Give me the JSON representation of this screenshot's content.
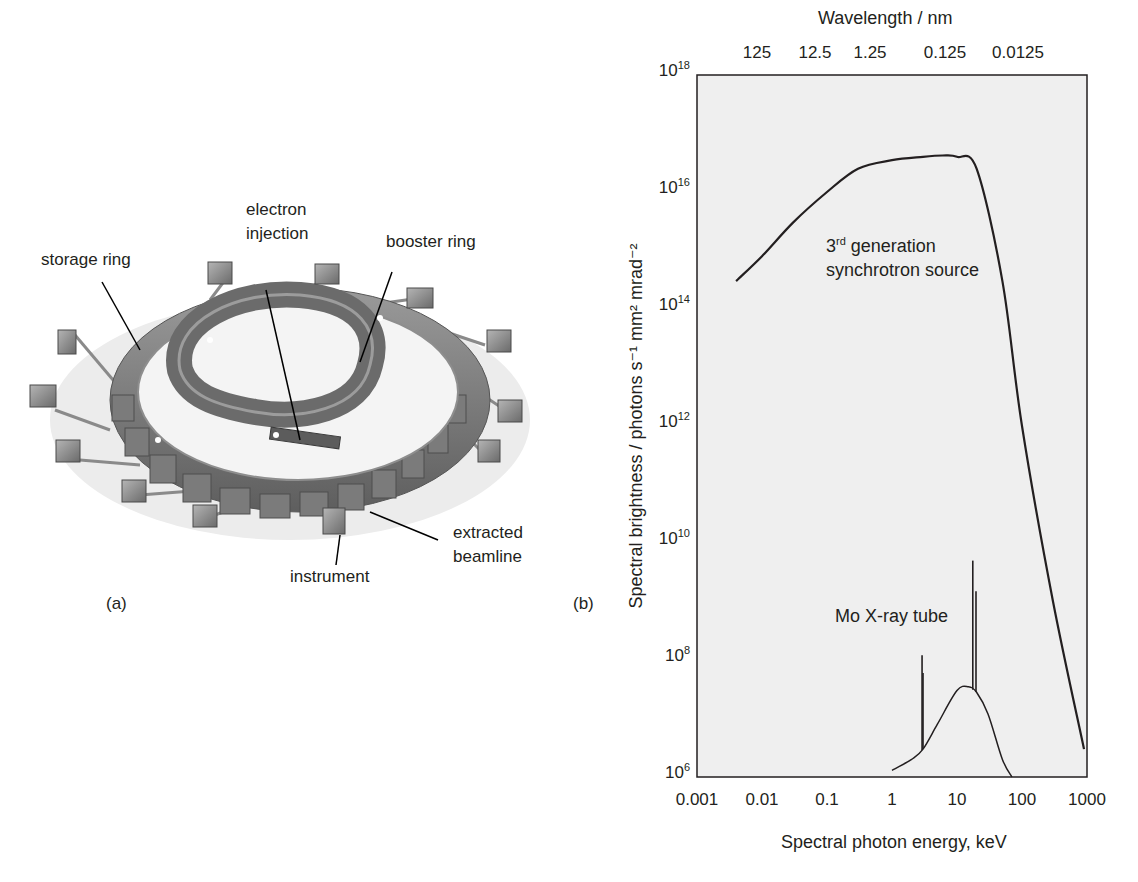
{
  "panel_a": {
    "label": "(a)",
    "title": "Synchrotron facility schematic",
    "callouts": {
      "storage_ring": "storage ring",
      "electron_injection_1": "electron",
      "electron_injection_2": "injection",
      "booster_ring": "booster ring",
      "extracted_beamline_1": "extracted",
      "extracted_beamline_2": "beamline",
      "instrument": "instrument"
    }
  },
  "panel_b": {
    "label": "(b)"
  },
  "chart_data": {
    "type": "line",
    "title": "",
    "top_axis_label": "Wavelength / nm",
    "top_ticks": [
      "125",
      "12.5",
      "1.25",
      "0.125",
      "0.0125"
    ],
    "xlabel": "Spectral photon energy, keV",
    "ylabel": "Spectral brightness / photons s⁻¹ mm² mrad⁻²",
    "x_scale": "log",
    "y_scale": "log",
    "xlim": [
      0.001,
      1000
    ],
    "ylim": [
      1000000.0,
      1e+18
    ],
    "x_ticks": [
      "0.001",
      "0.01",
      "0.1",
      "1",
      "10",
      "100",
      "1000"
    ],
    "y_ticks": [
      {
        "base": "10",
        "exp": "18"
      },
      {
        "base": "10",
        "exp": "16"
      },
      {
        "base": "10",
        "exp": "14"
      },
      {
        "base": "10",
        "exp": "12"
      },
      {
        "base": "10",
        "exp": "10"
      },
      {
        "base": "10",
        "exp": "8"
      },
      {
        "base": "10",
        "exp": "6"
      }
    ],
    "grid": false,
    "series": [
      {
        "name": "3rd generation synchrotron source",
        "annotation_1_pre": "3",
        "annotation_1_sup": "rd",
        "annotation_1_post": " generation",
        "annotation_2": "synchrotron source",
        "x": [
          0.004,
          0.01,
          0.03,
          0.1,
          0.3,
          1,
          3,
          6,
          10,
          20,
          50,
          100,
          300,
          900
        ],
        "y": [
          300000000000000.0,
          800000000000000.0,
          3000000000000000.0,
          1e+16,
          2.5e+16,
          3.5e+16,
          4e+16,
          4.2e+16,
          4e+16,
          2.5e+16,
          300000000000000.0,
          1000000000000.0,
          1000000000.0,
          3000000.0
        ]
      },
      {
        "name": "Mo X-ray tube",
        "annotation": "Mo X-ray tube",
        "x": [
          1,
          2,
          3,
          5,
          10,
          15,
          20,
          30,
          50,
          70
        ],
        "y": [
          1300000.0,
          2000000.0,
          3000000.0,
          8000000.0,
          30000000.0,
          35000000.0,
          28000000.0,
          12000000.0,
          2000000.0,
          1000000.0
        ],
        "emission_lines": [
          {
            "x_keV": 2.9,
            "peak": 120000000.0
          },
          {
            "x_keV": 3.0,
            "peak": 60000000.0
          },
          {
            "x_keV": 17.5,
            "peak": 5000000000.0
          },
          {
            "x_keV": 19.6,
            "peak": 1500000000.0
          }
        ]
      }
    ],
    "plot_background": "#efefef",
    "line_color": "#231f20"
  }
}
